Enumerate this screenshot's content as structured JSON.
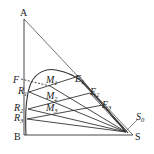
{
  "diagram": {
    "type": "ternary-phase-diagram-extraction",
    "colors": {
      "line": "#333333",
      "background": "#ffffff",
      "text": "#222222"
    },
    "vertices": {
      "A": {
        "label": "A",
        "x": 24,
        "y": 19
      },
      "B": {
        "label": "B",
        "x": 24,
        "y": 135
      },
      "S": {
        "label": "S",
        "x": 133,
        "y": 135
      }
    },
    "points": {
      "F": {
        "label": "F",
        "sub": "",
        "x": 20,
        "y": 79
      },
      "R1": {
        "label": "R",
        "sub": "1",
        "x": 29,
        "y": 92
      },
      "R2": {
        "label": "R",
        "sub": "2",
        "x": 28,
        "y": 109
      },
      "R3": {
        "label": "R",
        "sub": "3",
        "x": 27,
        "y": 119
      },
      "E1": {
        "label": "E",
        "sub": "1",
        "x": 79,
        "y": 76
      },
      "E2": {
        "label": "E",
        "sub": "2",
        "x": 90,
        "y": 93
      },
      "E3": {
        "label": "E",
        "sub": "3",
        "x": 103,
        "y": 105
      },
      "M1": {
        "label": "M",
        "sub": "1",
        "x": 50,
        "y": 84
      },
      "M2": {
        "label": "M",
        "sub": "2",
        "x": 52,
        "y": 95
      },
      "M3": {
        "label": "M",
        "sub": "3",
        "x": 52,
        "y": 106
      },
      "S0": {
        "label": "S",
        "sub": "0",
        "x": 137,
        "y": 117
      }
    },
    "labels": {
      "A": "A",
      "B": "B",
      "S": "S",
      "F": "F",
      "R": "R",
      "E": "E",
      "M": "M",
      "S0_main": "S",
      "sub1": "1",
      "sub2": "2",
      "sub3": "3",
      "sub0": "0"
    }
  }
}
